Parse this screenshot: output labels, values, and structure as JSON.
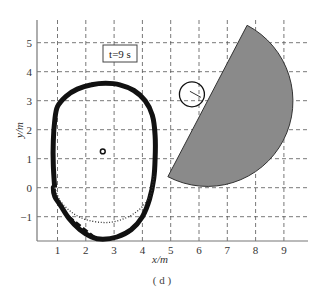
{
  "figure": {
    "caption": "( d )",
    "annotation": "t=9 s"
  },
  "chart_data": {
    "type": "line",
    "title": "",
    "annotation": "t=9 s",
    "caption": "(d)",
    "xlabel": "x/m",
    "ylabel": "y/m",
    "xlim": [
      0.3,
      9.8
    ],
    "ylim": [
      -1.85,
      5.6
    ],
    "xticks": [
      1,
      2,
      3,
      4,
      5,
      6,
      7,
      8,
      9
    ],
    "yticks": [
      -1,
      0,
      1,
      2,
      3,
      4,
      5
    ],
    "grid": "dashed",
    "series": [
      {
        "name": "trajectory (thick solid)",
        "style": "thick-solid",
        "x": [
          0.9,
          0.85,
          0.85,
          0.9,
          1.0,
          1.3,
          1.7,
          2.2,
          2.7,
          3.2,
          3.7,
          4.1,
          4.35,
          4.45,
          4.45,
          4.4,
          4.25,
          4.0,
          3.6,
          3.1,
          2.6,
          2.2,
          1.8,
          1.4,
          1.1,
          0.9,
          0.85,
          0.9
        ],
        "y": [
          0.0,
          0.8,
          1.6,
          2.3,
          2.8,
          3.15,
          3.4,
          3.55,
          3.6,
          3.55,
          3.35,
          3.0,
          2.5,
          1.8,
          1.0,
          0.3,
          -0.4,
          -1.0,
          -1.45,
          -1.7,
          -1.78,
          -1.7,
          -1.45,
          -1.05,
          -0.6,
          -0.3,
          0.0,
          0.0
        ]
      },
      {
        "name": "reference (dotted)",
        "style": "dotted",
        "x": [
          0.9,
          1.1,
          1.5,
          2.0,
          2.6,
          3.1,
          3.6,
          4.0,
          4.3,
          4.4
        ],
        "y": [
          0.0,
          -0.45,
          -0.85,
          -1.1,
          -1.2,
          -1.15,
          -0.95,
          -0.65,
          -0.2,
          0.4
        ]
      },
      {
        "name": "dashed segment",
        "style": "dashed",
        "x": [
          1.4,
          2.3
        ],
        "y": [
          -1.0,
          -1.7
        ]
      }
    ],
    "markers": [
      {
        "name": "small-dot",
        "x": 2.6,
        "y": 1.25
      }
    ],
    "shapes": [
      {
        "name": "half-disc obstacle",
        "fill": "#8a8a8a",
        "diameter_from": [
          7.7,
          5.6
        ],
        "diameter_to": [
          4.9,
          0.38
        ],
        "radius_m": 3.0
      },
      {
        "name": "circle",
        "center": [
          5.75,
          3.22
        ],
        "radius_m": 0.44
      }
    ]
  },
  "colors": {
    "grid": "#555555",
    "axis": "#777777",
    "trajectory": "#111111",
    "obstacle_fill": "#8a8a8a",
    "obstacle_stroke": "#333333"
  }
}
